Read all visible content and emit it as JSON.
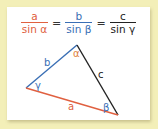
{
  "formula": {
    "fractions": [
      {
        "numerator": "a",
        "denominator": "sin α",
        "color": "#e06040"
      },
      {
        "numerator": "b",
        "denominator": "sin β",
        "color": "#3a6fb5"
      },
      {
        "numerator": "c",
        "denominator": "sin γ",
        "color": "#222222"
      }
    ],
    "equals": "="
  },
  "triangle": {
    "sides": {
      "a": "a",
      "b": "b",
      "c": "c"
    },
    "angles": {
      "alpha": "α",
      "beta": "β",
      "gamma": "γ"
    },
    "colors": {
      "a": "#e06040",
      "b": "#3a6fb5",
      "c": "#222222",
      "alpha": "#e08040",
      "beta": "#3a6fb5",
      "gamma": "#3a6fb5"
    }
  }
}
